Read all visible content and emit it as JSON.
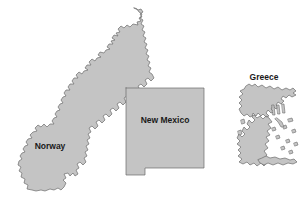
{
  "figure": {
    "type": "size-comparison-map",
    "background_color": "#ffffff",
    "width": 304,
    "height": 199
  },
  "style": {
    "land_fill": "#c4c4c4",
    "land_stroke": "#6b6b6b",
    "island_fill": "#c4c4c4",
    "label_color": "#1a1a1a",
    "stroke_width": 0.7
  },
  "regions": [
    {
      "id": "norway",
      "label": "Norway",
      "label_x": 50,
      "label_y": 147,
      "label_size": 8.5,
      "fill": "#c4c4c4",
      "stroke": "#6b6b6b"
    },
    {
      "id": "new-mexico",
      "label": "New Mexico",
      "label_x": 165,
      "label_y": 121,
      "label_size": 8.5,
      "fill": "#c4c4c4",
      "stroke": "#6b6b6b"
    },
    {
      "id": "greece",
      "label": "Greece",
      "label_x": 264,
      "label_y": 78,
      "label_size": 8.5,
      "fill": "#c4c4c4",
      "stroke": "#6b6b6b"
    }
  ]
}
